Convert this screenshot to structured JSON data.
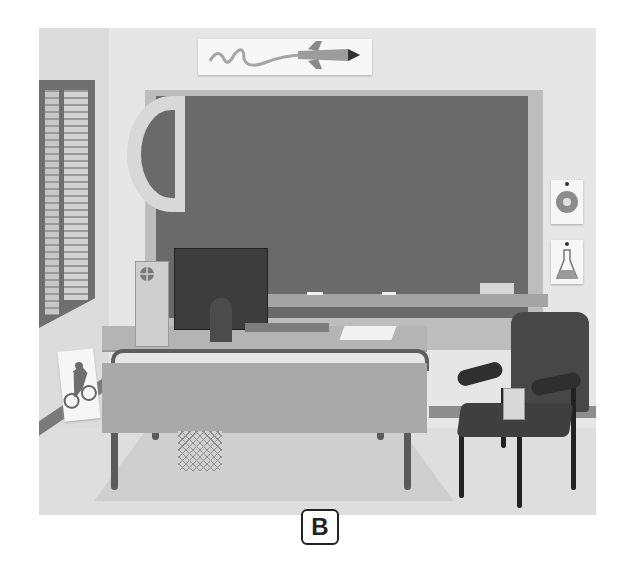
{
  "scene": {
    "description": "Classroom illustration: teacher's desk with computer in front of chalkboard, chair with pencil cup, posters on walls",
    "label": "B",
    "objects": {
      "rocket_poster": "rocket-poster",
      "chalkboard": "chalkboard",
      "protractor": "protractor",
      "flower_poster": "flower-poster",
      "flask_poster": "flask-poster",
      "bicycle_poster": "bicycle-poster",
      "window": "window-with-blinds",
      "desk": "teacher-desk",
      "computer_tower": "computer-tower",
      "monitor": "monitor",
      "keyboard": "keyboard",
      "papers": "papers",
      "wastebasket": "wastebasket",
      "chair": "chair",
      "pencil_cup": "pencil-cup"
    }
  },
  "colors": {
    "wall": "#e6e6e6",
    "board": "#6a6a6a",
    "board_frame": "#bdbdbd",
    "desk": "#b4b4b4",
    "chair": "#474747"
  }
}
